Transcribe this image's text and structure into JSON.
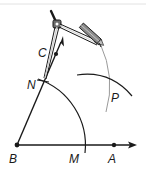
{
  "figure": {
    "type": "geometric-construction",
    "colors": {
      "ink": "#1a1a1a",
      "arc_light": "#9a9a9a",
      "background": "#ffffff",
      "top_rule": "#d8d8d8"
    },
    "points": [
      {
        "label": "B",
        "x": 17,
        "y": 145
      },
      {
        "label": "M",
        "x": 83,
        "y": 145
      },
      {
        "label": "A",
        "x": 114,
        "y": 145
      },
      {
        "label": "N",
        "x": 43,
        "y": 80
      },
      {
        "label": "C",
        "x": 56,
        "y": 55
      },
      {
        "label": "P",
        "x": 112,
        "y": 102
      }
    ],
    "labels": {
      "B": "B",
      "M": "M",
      "A": "A",
      "N": "N",
      "C": "C",
      "P": "P"
    },
    "tool": "compass"
  }
}
